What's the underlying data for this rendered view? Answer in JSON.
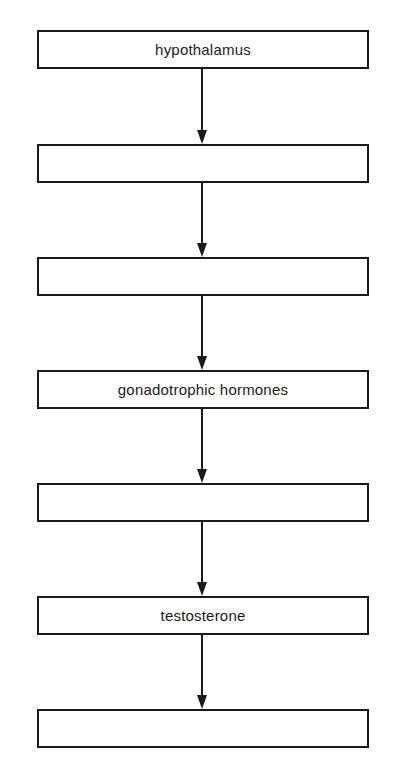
{
  "diagram": {
    "type": "flowchart",
    "direction": "top-to-bottom",
    "boxes": [
      {
        "label": "hypothalamus"
      },
      {
        "label": ""
      },
      {
        "label": ""
      },
      {
        "label": "gonadotrophic hormones"
      },
      {
        "label": ""
      },
      {
        "label": "testosterone"
      },
      {
        "label": ""
      }
    ],
    "arrows": [
      {
        "from": 0,
        "to": 1
      },
      {
        "from": 1,
        "to": 2
      },
      {
        "from": 2,
        "to": 3
      },
      {
        "from": 3,
        "to": 4
      },
      {
        "from": 4,
        "to": 5
      },
      {
        "from": 5,
        "to": 6
      }
    ],
    "colors": {
      "stroke": "#1a1a1a",
      "fill": "#ffffff",
      "text": "#1a1a1a"
    }
  }
}
